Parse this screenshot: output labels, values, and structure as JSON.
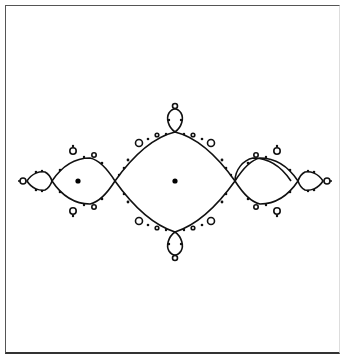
{
  "figure": {
    "colors": {
      "line": "#111111",
      "background": "#ffffff",
      "frame": "#555555"
    },
    "marked_points": [
      {
        "name": "left-bulb-center",
        "x": 78,
        "y": 181
      },
      {
        "name": "main-bulb-center",
        "x": 175,
        "y": 181
      }
    ]
  }
}
